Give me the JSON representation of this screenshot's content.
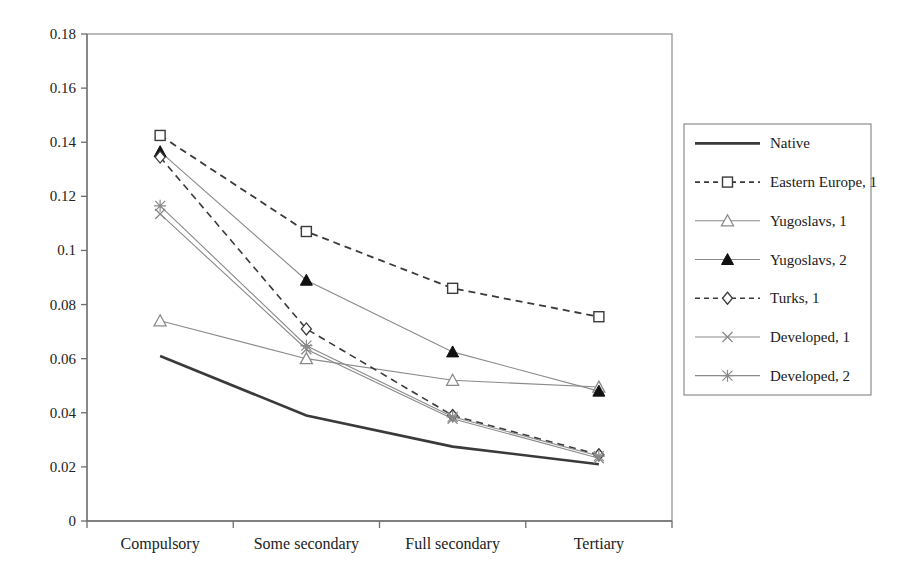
{
  "chart_data": {
    "type": "line",
    "title": "",
    "xlabel": "",
    "ylabel": "",
    "categories": [
      "Compulsory",
      "Some secondary",
      "Full secondary",
      "Tertiary"
    ],
    "ylim": [
      0,
      0.18
    ],
    "ytick_labels": [
      "0",
      "0.02",
      "0.04",
      "0.06",
      "0.08",
      "0.1",
      "0.12",
      "0.14",
      "0.16",
      "0.18"
    ],
    "ytick_values": [
      0,
      0.02,
      0.04,
      0.06,
      0.08,
      0.1,
      0.12,
      0.14,
      0.16,
      0.18
    ],
    "grid": false,
    "legend_position": "right",
    "series": [
      {
        "name": "Native",
        "values": [
          0.061,
          0.039,
          0.0275,
          0.021
        ],
        "marker": "none",
        "dash": "solid",
        "color": "#3a3a3a",
        "width": 2.6
      },
      {
        "name": "Eastern Europe, 1",
        "values": [
          0.1425,
          0.107,
          0.086,
          0.0755
        ],
        "marker": "square-open",
        "dash": "dashed",
        "color": "#3a3a3a",
        "width": 1.8
      },
      {
        "name": "Yugoslavs, 1",
        "values": [
          0.074,
          0.06,
          0.052,
          0.0495
        ],
        "marker": "triangle-open",
        "dash": "solid",
        "color": "#8a8a8a",
        "width": 1.1
      },
      {
        "name": "Yugoslavs, 2",
        "values": [
          0.1365,
          0.089,
          0.0625,
          0.048
        ],
        "marker": "triangle-filled",
        "dash": "solid",
        "color": "#8a8a8a",
        "width": 1.1
      },
      {
        "name": "Turks, 1",
        "values": [
          0.1345,
          0.071,
          0.039,
          0.0245
        ],
        "marker": "diamond-open",
        "dash": "dashed",
        "color": "#3a3a3a",
        "width": 1.6
      },
      {
        "name": "Developed, 1",
        "values": [
          0.1135,
          0.0635,
          0.0378,
          0.0232
        ],
        "marker": "x",
        "dash": "solid",
        "color": "#8a8a8a",
        "width": 1.1
      },
      {
        "name": "Developed, 2",
        "values": [
          0.1165,
          0.0648,
          0.0385,
          0.024
        ],
        "marker": "star",
        "dash": "solid",
        "color": "#8a8a8a",
        "width": 1.1
      }
    ]
  },
  "legend": {
    "entries": [
      "Native",
      "Eastern Europe, 1",
      "Yugoslavs, 1",
      "Yugoslavs, 2",
      "Turks, 1",
      "Developed, 1",
      "Developed, 2"
    ]
  },
  "colors": {
    "dark_line": "#3a3a3a",
    "light_line": "#8a8a8a",
    "axis": "#8c8c8c",
    "text": "#1a1a1a",
    "background": "#ffffff"
  }
}
